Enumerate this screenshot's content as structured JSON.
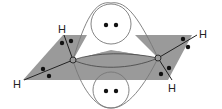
{
  "diagram": {
    "type": "molecular-orbital",
    "colors": {
      "plane": "#9a9a9a",
      "line": "#444444",
      "electron": "#111111",
      "lobe_outline": "#777777",
      "background": "#ffffff"
    },
    "atoms": {
      "carbon_left": "C",
      "carbon_right": "C",
      "h_top_left": "H",
      "h_left": "H",
      "h_right": "H",
      "h_bottom_right": "H"
    },
    "lobes": {
      "top": {
        "electrons": 2
      },
      "bottom": {
        "electrons": 2
      }
    }
  }
}
